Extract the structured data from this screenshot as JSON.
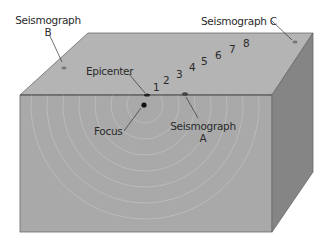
{
  "diagram": {
    "colors": {
      "top_face": "#b4b4b4",
      "front_face": "#a9a9a9",
      "side_face": "#858585",
      "edge": "#555555",
      "ring": "#bdbdbd",
      "label": "#2a2a2a"
    },
    "labels": {
      "seismograph_b_line1": "Seismograph",
      "seismograph_b_line2": "B",
      "seismograph_c": "Seismograph C",
      "epicenter": "Epicenter",
      "focus": "Focus",
      "seismograph_a_line1": "Seismograph",
      "seismograph_a_line2": "A"
    },
    "wave_numbers": [
      "1",
      "2",
      "3",
      "4",
      "5",
      "6",
      "7",
      "8"
    ]
  }
}
